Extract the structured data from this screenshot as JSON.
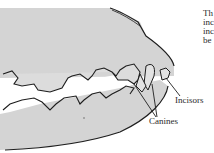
{
  "figure": {
    "labels": {
      "incisors": "Incisors",
      "canines": "Canines"
    },
    "side_text_lines": [
      "Th",
      "inc",
      "inc",
      "be"
    ],
    "colors": {
      "jaw_fill": "#d4d4d4",
      "outline": "#1e1e1e",
      "tooth_fill": "#dcdcdc",
      "text": "#2a2a2a"
    }
  }
}
